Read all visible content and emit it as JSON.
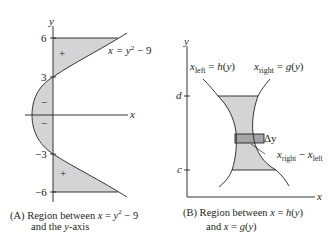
{
  "panel_a": {
    "id": "(A)",
    "caption_line1_prefix": "(A)  Region between ",
    "caption_line1_math": "x = y² − 9",
    "caption_line2": "and the y-axis",
    "axis_x_label": "x",
    "axis_y_label": "y",
    "y_ticks": [
      "6",
      "3",
      "−3",
      "−6"
    ],
    "curve_label": "x = y² − 9",
    "region_signs": [
      "+",
      "−",
      "−",
      "+"
    ],
    "fill_color": "#d4d4d6",
    "line_color": "#231f20"
  },
  "panel_b": {
    "id": "(B)",
    "caption_line1_prefix": "(B)  Region between ",
    "caption_line1_math": "x = h(y)",
    "caption_line2": "and x = g(y)",
    "axis_x_label": "x",
    "axis_y_label": "y",
    "y_ticks": [
      "d",
      "c"
    ],
    "left_curve_label": "x_left = h(y)",
    "right_curve_label": "x_right = g(y)",
    "strip_label": "Δy",
    "width_label": "x_right − x_left",
    "fill_color": "#d4d4d6",
    "strip_color": "#a6a6a8"
  }
}
